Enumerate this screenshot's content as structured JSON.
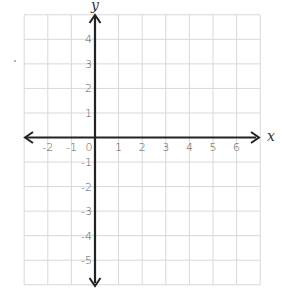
{
  "chart_data": {
    "type": "coordinate-grid",
    "title": "",
    "xlabel": "x",
    "ylabel": "y",
    "xlim": [
      -3,
      7
    ],
    "ylim": [
      -6,
      5
    ],
    "grid": true,
    "x_ticks": [
      "-2",
      "-1",
      "0",
      "1",
      "2",
      "3",
      "4",
      "5",
      "6"
    ],
    "y_ticks": [
      "4",
      "3",
      "2",
      "1",
      "-1",
      "-2",
      "-3",
      "-4",
      "-5"
    ],
    "x_tick_values": [
      -2,
      -1,
      0,
      1,
      2,
      3,
      4,
      5,
      6
    ],
    "y_tick_values": [
      4,
      3,
      2,
      1,
      -1,
      -2,
      -3,
      -4,
      -5
    ],
    "points": [],
    "series": []
  },
  "labels": {
    "x_axis": "x",
    "y_axis": "y"
  },
  "colors": {
    "grid": "#d8d8d8",
    "axis": "#222222",
    "tick_text": "#555555"
  }
}
